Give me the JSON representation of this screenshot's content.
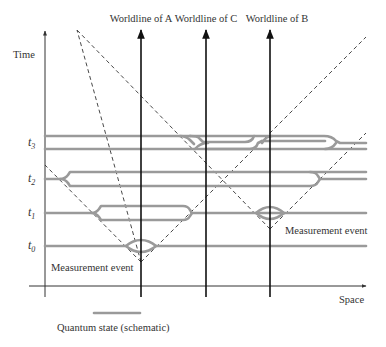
{
  "diagram": {
    "worldlines": [
      {
        "id": "A",
        "label": "Worldline of A",
        "x": 141
      },
      {
        "id": "C",
        "label": "Worldline of C",
        "x": 206
      },
      {
        "id": "B",
        "label": "Worldline of B",
        "x": 270
      }
    ],
    "axes": {
      "time_label": "Time",
      "space_label": "Space"
    },
    "time_labels": [
      {
        "label": "t",
        "sub": "3",
        "y": 143
      },
      {
        "label": "t",
        "sub": "2",
        "y": 179
      },
      {
        "label": "t",
        "sub": "1",
        "y": 213
      },
      {
        "label": "t",
        "sub": "0",
        "y": 246
      }
    ],
    "annotations": {
      "measurement_event_a": "Measurement event",
      "measurement_event_b": "Measurement event"
    },
    "legend": {
      "quantum_state": "Quantum state (schematic)"
    },
    "colors": {
      "quantum_state": "#9a9a9a",
      "worldline": "#111111",
      "light_cone": "#333333"
    }
  }
}
